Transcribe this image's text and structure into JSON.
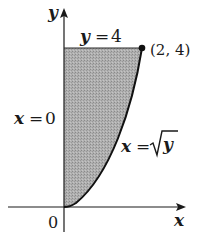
{
  "figure": {
    "axes": {
      "x_label": "x",
      "y_label": "y",
      "origin_label": "0"
    },
    "region": {
      "description": "Shaded region bounded by x = 0, y = 4, and x = √y",
      "fill_color": "#a8a8a8"
    },
    "boundaries": {
      "top": {
        "label": "y = 4",
        "lhs": "y",
        "eq": "=",
        "rhs": "4"
      },
      "left": {
        "label": "x = 0",
        "lhs": "x",
        "eq": "=",
        "rhs": "0"
      },
      "curve": {
        "label": "x = √y",
        "lhs": "x",
        "eq": "=",
        "radical": "√",
        "radicand": "y"
      }
    },
    "point": {
      "label": "(2, 4)",
      "x": 2,
      "y": 4
    }
  }
}
